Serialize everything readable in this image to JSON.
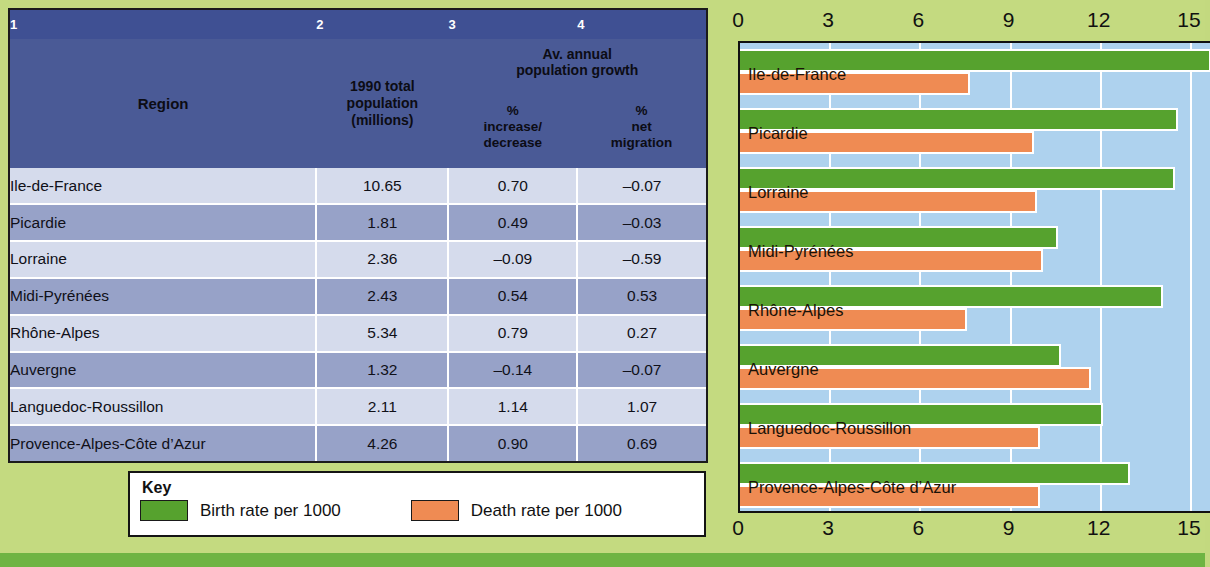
{
  "colors": {
    "page_bg": "#c4da80",
    "bottom_strip": "#6fb443",
    "header_blue": "#4a5a96",
    "row_light": "#d5dbec",
    "row_dark": "#97a2c8",
    "plot_bg": "#aed2ee",
    "birth_green": "#56a22e",
    "death_orange": "#ef8b53"
  },
  "table": {
    "column_numbers": [
      "1",
      "2",
      "3",
      "4"
    ],
    "headers": {
      "region": "Region",
      "population": "1990 total population (millions)",
      "population_lines": [
        "1990 total",
        "population",
        "(millions)"
      ],
      "growth_group": "Av. annual population growth",
      "growth_group_lines": [
        "Av. annual",
        "population growth"
      ],
      "increase": "% increase/ decrease",
      "increase_lines": [
        "%",
        "increase/",
        "decrease"
      ],
      "migration": "% net migration",
      "migration_lines": [
        "%",
        "net",
        "migration"
      ]
    },
    "rows": [
      {
        "region": "Ile-de-France",
        "population": "10.65",
        "increase": "0.70",
        "migration": "–0.07"
      },
      {
        "region": "Picardie",
        "population": "1.81",
        "increase": "0.49",
        "migration": "–0.03"
      },
      {
        "region": "Lorraine",
        "population": "2.36",
        "increase": "–0.09",
        "migration": "–0.59"
      },
      {
        "region": "Midi-Pyrénées",
        "population": "2.43",
        "increase": "0.54",
        "migration": "0.53"
      },
      {
        "region": "Rhône-Alpes",
        "population": "5.34",
        "increase": "0.79",
        "migration": "0.27"
      },
      {
        "region": "Auvergne",
        "population": "1.32",
        "increase": "–0.14",
        "migration": "–0.07"
      },
      {
        "region": "Languedoc-Roussillon",
        "population": "2.11",
        "increase": "1.14",
        "migration": "1.07"
      },
      {
        "region": "Provence-Alpes-Côte d’Azur",
        "population": "4.26",
        "increase": "0.90",
        "migration": "0.69"
      }
    ]
  },
  "key": {
    "title": "Key",
    "items": [
      {
        "label": "Birth rate per 1000",
        "color": "#56a22e"
      },
      {
        "label": "Death rate per 1000",
        "color": "#ef8b53"
      }
    ]
  },
  "chart_data": {
    "type": "bar",
    "orientation": "horizontal",
    "title": "",
    "xlabel": "",
    "ylabel": "",
    "xlim": [
      0,
      15.7
    ],
    "ticks": [
      "0",
      "3",
      "6",
      "9",
      "12",
      "15"
    ],
    "tick_values": [
      0,
      3,
      6,
      9,
      12,
      15
    ],
    "grid": true,
    "axis_positions": [
      "top",
      "bottom"
    ],
    "legend": [
      "Birth rate per 1000",
      "Death rate per 1000"
    ],
    "legend_position": "below-table",
    "categories": [
      "Ile-de-France",
      "Picardie",
      "Lorraine",
      "Midi-Pyrénées",
      "Rhône-Alpes",
      "Auvergne",
      "Languedoc-Roussillon",
      "Provence-Alpes-Côte d’Azur"
    ],
    "series": [
      {
        "name": "Birth rate per 1000",
        "color": "#56a22e",
        "values": [
          15.6,
          14.5,
          14.4,
          10.5,
          14.0,
          10.6,
          12.0,
          12.9
        ]
      },
      {
        "name": "Death rate per 1000",
        "color": "#ef8b53",
        "values": [
          7.6,
          9.7,
          9.8,
          10.0,
          7.5,
          11.6,
          9.9,
          9.9
        ]
      }
    ]
  }
}
